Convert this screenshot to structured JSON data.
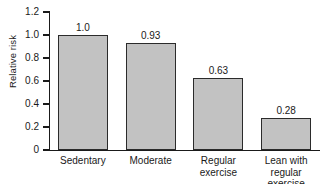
{
  "chart_data": {
    "type": "bar",
    "title": "",
    "subtitle": "",
    "xlabel": "",
    "ylabel": "Relative risk",
    "categories": [
      "Sedentary",
      "Moderate",
      "Regular exercise",
      "Lean with regular exercise"
    ],
    "category_lines": [
      [
        "Sedentary"
      ],
      [
        "Moderate"
      ],
      [
        "Regular",
        "exercise"
      ],
      [
        "Lean with",
        "regular exercise"
      ]
    ],
    "values": [
      1.0,
      0.93,
      0.63,
      0.28
    ],
    "value_labels": [
      "1.0",
      "0.93",
      "0.63",
      "0.28"
    ],
    "ylim": [
      0,
      1.2
    ],
    "yticks": [
      0,
      0.2,
      0.4,
      0.6,
      0.8,
      1.0,
      1.2
    ],
    "ytick_labels": [
      "0",
      "0.2",
      "0.4",
      "0.6",
      "0.8",
      "1.0",
      "1.2"
    ],
    "grid": false,
    "legend": false,
    "legend_position": "none",
    "bar_fill_color": "#c2c2c2",
    "bar_edge_color": "#2b2b2b",
    "axis_color": "#1a1a1a",
    "background_color": "#ffffff"
  }
}
